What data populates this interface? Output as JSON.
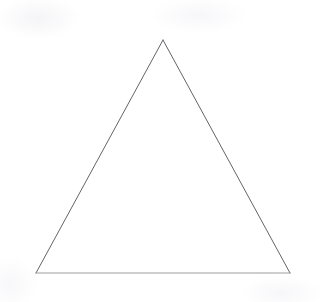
{
  "figure": {
    "kind": "geometric-shape",
    "shape_name": "triangle",
    "shape_subtype": "isosceles-triangle",
    "caption": "",
    "canvas": {
      "width": 320,
      "height": 302
    },
    "background_color": "#ffffff",
    "paper_tint_color": "#fefeff"
  },
  "chart_data": {
    "type": "scatter",
    "title": "",
    "xlabel": "",
    "ylabel": "",
    "grid": false,
    "legend": null,
    "xlim": [
      0,
      320
    ],
    "ylim": [
      0,
      302
    ],
    "shapes": [
      {
        "name": "triangle",
        "type": "polygon",
        "closed": true,
        "fill": "none",
        "stroke": "#6a6a70",
        "stroke_width": 1,
        "vertices": [
          {
            "label": "apex",
            "x": 163,
            "y": 40
          },
          {
            "label": "bottom-right",
            "x": 290,
            "y": 273
          },
          {
            "label": "bottom-left",
            "x": 36,
            "y": 273
          }
        ],
        "edges": [
          {
            "label": "left-side",
            "from": "bottom-left",
            "to": "apex",
            "stroke": "#63636a",
            "stroke_width": 1,
            "length": 265
          },
          {
            "label": "right-side",
            "from": "apex",
            "to": "bottom-right",
            "stroke": "#63636a",
            "stroke_width": 1,
            "length": 265
          },
          {
            "label": "base",
            "from": "bottom-left",
            "to": "bottom-right",
            "stroke": "#8d8d94",
            "stroke_width": 0.85,
            "length": 254
          }
        ],
        "base_width": 254,
        "height": 233,
        "apex_angle_deg": 57,
        "base_angle_deg": 61
      }
    ]
  }
}
